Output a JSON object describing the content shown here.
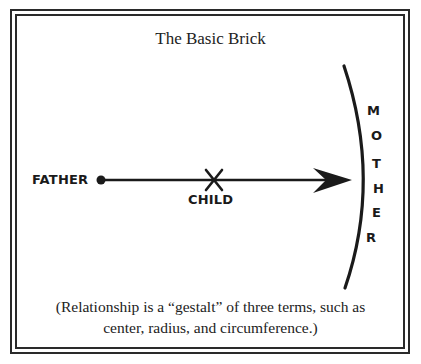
{
  "diagram": {
    "title": "The Basic Brick",
    "nodes": {
      "father": "FATHER",
      "child": "CHILD",
      "mother_letters": [
        "M",
        "O",
        "T",
        "H",
        "E",
        "R"
      ]
    },
    "caption_lines": [
      "(Relationship is a “gestalt” of three terms, such as",
      "center, radius, and circumference.)"
    ],
    "colors": {
      "ink": "#1a1a1a",
      "background": "#ffffff"
    }
  }
}
